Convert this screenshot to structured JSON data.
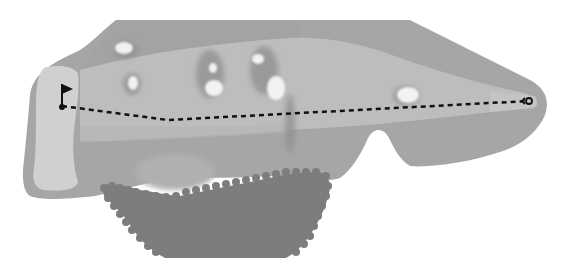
{
  "diagram": {
    "type": "golf-hole-layout",
    "orientation": "tee-right-green-left",
    "colors": {
      "background": "#ffffff",
      "rough": "#a6a6a6",
      "fairway": "#bdbdbd",
      "green": "#d0d0d0",
      "tee_box": "#c4c4c4",
      "bunker": "#f2f2f2",
      "bunker_shadow": "#8f8f8f",
      "trees": "#7d7d7d",
      "path_line": "#111111",
      "flag": "#111111"
    },
    "elements": {
      "green": {
        "label": "green",
        "x": 33,
        "y": 68,
        "w": 46,
        "h": 122
      },
      "flag": {
        "label": "pin-flag",
        "x": 62,
        "y": 106
      },
      "tee": {
        "label": "tee-marker",
        "x": 528,
        "y": 101
      },
      "shot_path": {
        "label": "dashed-shot-line",
        "points": [
          [
            62,
            106
          ],
          [
            168,
            120
          ],
          [
            528,
            101
          ]
        ]
      },
      "bunkers": [
        {
          "cx": 124,
          "cy": 48,
          "rx": 9,
          "ry": 6
        },
        {
          "cx": 133,
          "cy": 83,
          "rx": 5,
          "ry": 7
        },
        {
          "cx": 213,
          "cy": 68,
          "rx": 4,
          "ry": 5
        },
        {
          "cx": 214,
          "cy": 88,
          "rx": 9,
          "ry": 8
        },
        {
          "cx": 258,
          "cy": 59,
          "rx": 6,
          "ry": 5
        },
        {
          "cx": 276,
          "cy": 88,
          "rx": 9,
          "ry": 12
        },
        {
          "cx": 408,
          "cy": 95,
          "rx": 11,
          "ry": 8
        }
      ],
      "tree_area": {
        "label": "tree-cluster"
      }
    }
  }
}
